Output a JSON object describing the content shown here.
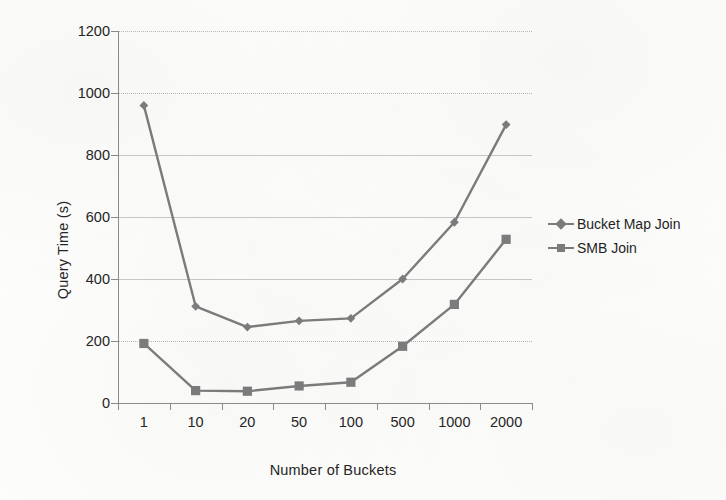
{
  "chart_data": {
    "type": "line",
    "title": "",
    "xlabel": "Number of Buckets",
    "ylabel": "Query Time (s)",
    "categories": [
      "1",
      "10",
      "20",
      "50",
      "100",
      "500",
      "1000",
      "2000"
    ],
    "ylim": [
      0,
      1200
    ],
    "ytick_step": 200,
    "yticks": [
      "1200",
      "1000",
      "800",
      "600",
      "400",
      "200",
      "0"
    ],
    "grid": true,
    "legend_position": "right",
    "series": [
      {
        "name": "Bucket Map Join",
        "marker": "diamond",
        "color": "#7d7d7d",
        "values": [
          960,
          312,
          245,
          265,
          273,
          400,
          583,
          898
        ]
      },
      {
        "name": "SMB Join",
        "marker": "square",
        "color": "#7d7d7d",
        "values": [
          192,
          40,
          38,
          55,
          67,
          183,
          318,
          528
        ]
      }
    ]
  },
  "legend": {
    "items": [
      {
        "label": "Bucket Map Join"
      },
      {
        "label": "SMB Join"
      }
    ]
  },
  "colors": {
    "series_gray": "#7d7d7d",
    "axis": "#8c8c8c",
    "gridline": "#b9b9b9",
    "text": "#262626",
    "background": "#fdfdfc"
  }
}
